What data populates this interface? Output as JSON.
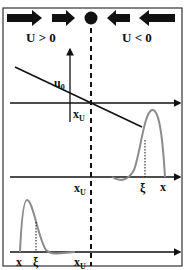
{
  "diagram": {
    "top_labels": {
      "left": "U > 0",
      "right": "U < 0"
    },
    "panel1": {
      "u0_label": "u",
      "u0_sub": "0",
      "xu_label": "x",
      "xu_sub": "U"
    },
    "panel2": {
      "xu_label": "x",
      "xu_sub": "U",
      "xi_label": "ξ",
      "x_label": "x"
    },
    "panel3": {
      "x_label": "x",
      "xi_label": "ξ",
      "xu_label": "x",
      "xu_sub": "U"
    },
    "colors": {
      "ink": "#111111",
      "curve": "#8c8c8c",
      "border": "#333333"
    }
  }
}
